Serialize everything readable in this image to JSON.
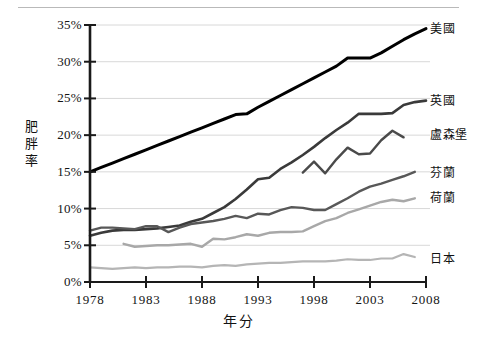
{
  "chart_data": {
    "type": "line",
    "title": "",
    "xlabel": "年分",
    "ylabel": "肥胖率",
    "xlim": [
      1978,
      2008
    ],
    "ylim": [
      0,
      35
    ],
    "grid": true,
    "grid_axis": "y",
    "legend_position": "right-inline-labels",
    "xticks": [
      1978,
      1983,
      1988,
      1993,
      1998,
      2003,
      2008
    ],
    "xtick_labels": [
      "1978",
      "1983",
      "1988",
      "1993",
      "1998",
      "2003",
      "2008"
    ],
    "yticks": [
      0,
      5,
      10,
      15,
      20,
      25,
      30,
      35
    ],
    "ytick_labels": [
      "0%",
      "5%",
      "10%",
      "15%",
      "20%",
      "25%",
      "30%",
      "35%"
    ],
    "series": [
      {
        "name": "美國",
        "color": "#000000",
        "width": 3.0,
        "label_x": 2008.4,
        "label_y": 34.6,
        "x": [
          1978,
          1979,
          1980,
          1981,
          1982,
          1983,
          1984,
          1985,
          1986,
          1987,
          1988,
          1989,
          1990,
          1991,
          1992,
          1993,
          1994,
          1995,
          1996,
          1997,
          1998,
          1999,
          2000,
          2001,
          2002,
          2003,
          2004,
          2005,
          2006,
          2007,
          2008
        ],
        "y": [
          15.0,
          15.6,
          16.2,
          16.8,
          17.4,
          18.0,
          18.6,
          19.2,
          19.8,
          20.4,
          21.0,
          21.6,
          22.2,
          22.8,
          22.9,
          23.8,
          24.6,
          25.4,
          26.2,
          27.0,
          27.8,
          28.6,
          29.4,
          30.5,
          30.5,
          30.5,
          31.2,
          32.1,
          33.0,
          33.8,
          34.5
        ]
      },
      {
        "name": "英國",
        "color": "#3a3a3a",
        "width": 2.6,
        "label_x": 2008.4,
        "label_y": 24.8,
        "x": [
          1978,
          1979,
          1980,
          1981,
          1982,
          1983,
          1984,
          1985,
          1986,
          1987,
          1988,
          1989,
          1990,
          1991,
          1992,
          1993,
          1994,
          1995,
          1996,
          1997,
          1998,
          1999,
          2000,
          2001,
          2002,
          2003,
          2004,
          2005,
          2006,
          2007,
          2008
        ],
        "y": [
          6.3,
          6.7,
          7.0,
          7.1,
          7.1,
          7.2,
          7.3,
          7.5,
          7.7,
          8.2,
          8.6,
          9.4,
          10.2,
          11.3,
          12.6,
          14.0,
          14.2,
          15.4,
          16.3,
          17.3,
          18.4,
          19.6,
          20.7,
          21.7,
          22.9,
          22.9,
          22.9,
          23.0,
          24.1,
          24.5,
          24.7
        ]
      },
      {
        "name": "盧森堡",
        "color": "#4a4a4a",
        "width": 2.4,
        "label_x": 2008.4,
        "label_y": 20.2,
        "x": [
          1997,
          1998,
          1999,
          2000,
          2001,
          2002,
          2003,
          2004,
          2005,
          2006
        ],
        "y": [
          14.9,
          16.4,
          14.8,
          16.7,
          18.3,
          17.4,
          17.5,
          19.3,
          20.6,
          19.7
        ]
      },
      {
        "name": "芬蘭",
        "color": "#585858",
        "width": 2.4,
        "label_x": 2008.4,
        "label_y": 15.0,
        "x": [
          1978,
          1979,
          1980,
          1981,
          1982,
          1983,
          1984,
          1985,
          1986,
          1987,
          1988,
          1989,
          1990,
          1991,
          1992,
          1993,
          1994,
          1995,
          1996,
          1997,
          1998,
          1999,
          2000,
          2001,
          2002,
          2003,
          2004,
          2005,
          2006,
          2007
        ],
        "y": [
          7.0,
          7.4,
          7.4,
          7.3,
          7.2,
          7.6,
          7.6,
          6.8,
          7.4,
          7.9,
          8.1,
          8.3,
          8.6,
          9.0,
          8.7,
          9.3,
          9.2,
          9.8,
          10.2,
          10.1,
          9.8,
          9.8,
          10.6,
          11.4,
          12.3,
          13.0,
          13.4,
          13.9,
          14.4,
          15.0
        ]
      },
      {
        "name": "荷蘭",
        "color": "#a8a8a8",
        "width": 2.4,
        "label_x": 2008.4,
        "label_y": 11.6,
        "x": [
          1981,
          1982,
          1983,
          1984,
          1985,
          1986,
          1987,
          1988,
          1989,
          1990,
          1991,
          1992,
          1993,
          1994,
          1995,
          1996,
          1997,
          1998,
          1999,
          2000,
          2001,
          2002,
          2003,
          2004,
          2005,
          2006,
          2007
        ],
        "y": [
          5.2,
          4.8,
          4.9,
          5.0,
          5.0,
          5.1,
          5.2,
          4.8,
          5.9,
          5.8,
          6.1,
          6.5,
          6.3,
          6.7,
          6.8,
          6.8,
          6.9,
          7.6,
          8.3,
          8.7,
          9.4,
          9.9,
          10.4,
          10.9,
          11.2,
          11.0,
          11.4
        ]
      },
      {
        "name": "日本",
        "color": "#b5b5b5",
        "width": 2.2,
        "label_x": 2008.4,
        "label_y": 3.3,
        "x": [
          1978,
          1979,
          1980,
          1981,
          1982,
          1983,
          1984,
          1985,
          1986,
          1987,
          1988,
          1989,
          1990,
          1991,
          1992,
          1993,
          1994,
          1995,
          1996,
          1997,
          1998,
          1999,
          2000,
          2001,
          2002,
          2003,
          2004,
          2005,
          2006,
          2007
        ],
        "y": [
          2.0,
          1.9,
          1.8,
          1.9,
          2.0,
          1.9,
          2.0,
          2.0,
          2.1,
          2.1,
          2.0,
          2.2,
          2.3,
          2.2,
          2.4,
          2.5,
          2.6,
          2.6,
          2.7,
          2.8,
          2.8,
          2.8,
          2.9,
          3.1,
          3.0,
          3.0,
          3.2,
          3.2,
          3.8,
          3.4
        ]
      }
    ]
  },
  "axes": {
    "ylabel_text": "肥\n胖\n率",
    "xlabel_text": "年分"
  },
  "colors": {
    "axis": "#1a1a1a",
    "grid": "#d8d8d8",
    "background": "#ffffff",
    "top_rule": "#b9b9b9"
  }
}
